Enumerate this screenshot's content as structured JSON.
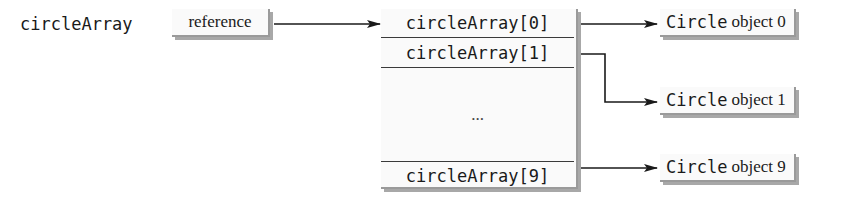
{
  "diagram": {
    "variable": {
      "name": "circleArray",
      "box_label": "reference"
    },
    "array": {
      "cells": [
        {
          "label": "circleArray[0]"
        },
        {
          "label": "circleArray[1]"
        },
        {
          "label": "..."
        },
        {
          "label": "circleArray[9]"
        }
      ]
    },
    "objects": [
      {
        "type_label": "Circle",
        "desc_label": "object 0"
      },
      {
        "type_label": "Circle",
        "desc_label": "object 1"
      },
      {
        "type_label": "Circle",
        "desc_label": "object 9"
      }
    ],
    "colors": {
      "line": "#1a1a1a",
      "box_fill": "#fafafa",
      "shadow": "#a8a8a8"
    }
  }
}
